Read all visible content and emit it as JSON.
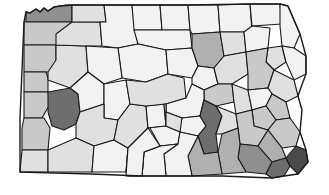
{
  "figure": {
    "name": "pennsylvania-county-choropleth",
    "title": "",
    "background_color": "#ffffff",
    "border_color": "#1a1a1a"
  },
  "chart_data": {
    "type": "choropleth",
    "title": "",
    "subtitle": "",
    "xlabel": "",
    "ylabel": "",
    "region": "Pennsylvania",
    "unit": "county",
    "grid": false,
    "legend_position": "none",
    "palette": {
      "level_0": "#f2f2f2",
      "level_1": "#e0e0e0",
      "level_2": "#c9c9c9",
      "level_3": "#b0b0b0",
      "level_4": "#8f8f8f",
      "level_5": "#6e6e6e",
      "level_6": "#4a4a4a"
    },
    "categories": [
      "Erie",
      "Crawford",
      "Warren",
      "McKean",
      "Potter",
      "Tioga",
      "Bradford",
      "Susquehanna",
      "Wayne",
      "Mercer",
      "Venango",
      "Forest",
      "Elk",
      "Cameron",
      "Clinton",
      "Lycoming",
      "Sullivan",
      "Wyoming",
      "Lackawanna",
      "Pike",
      "Lawrence",
      "Butler",
      "Clarion",
      "Jefferson",
      "Clearfield",
      "Centre",
      "Union",
      "Snyder",
      "Northumberland",
      "Montour",
      "Columbia",
      "Luzerne",
      "Monroe",
      "Beaver",
      "Allegheny",
      "Armstrong",
      "Indiana",
      "Cambria",
      "Blair",
      "Huntingdon",
      "Mifflin",
      "Juniata",
      "Perry",
      "Dauphin",
      "Schuylkill",
      "Carbon",
      "Northampton",
      "Lehigh",
      "Berks",
      "Lebanon",
      "Washington",
      "Westmoreland",
      "Somerset",
      "Bedford",
      "Fulton",
      "Franklin",
      "Cumberland",
      "York",
      "Lancaster",
      "Chester",
      "Montgomery",
      "Bucks",
      "Delaware",
      "Philadelphia",
      "Greene",
      "Fayette",
      "Adams",
      "Mercer-north",
      "Venango-east"
    ],
    "values": [
      4,
      2,
      1,
      0,
      0,
      0,
      0,
      0,
      0,
      2,
      1,
      0,
      0,
      0,
      0,
      3,
      0,
      0,
      2,
      0,
      2,
      1,
      0,
      0,
      0,
      1,
      0,
      0,
      2,
      0,
      0,
      2,
      1,
      2,
      5,
      0,
      0,
      1,
      0,
      0,
      0,
      0,
      0,
      5,
      1,
      0,
      2,
      2,
      2,
      1,
      2,
      1,
      0,
      0,
      0,
      0,
      1,
      3,
      3,
      4,
      3,
      2,
      5,
      6,
      1,
      1,
      0,
      2,
      1
    ],
    "value_range": [
      0,
      6
    ]
  },
  "map": {
    "name": "pennsylvania-counties",
    "counties": [
      {
        "name": "Erie",
        "shade": "#8f8f8f",
        "d": "M26,22 L26,12 L30,13 L36,9 L40,12 L44,8 L48,11 L54,7 L60,6 L66,5 L72,5 L72,22 Z"
      },
      {
        "name": "Crawford",
        "shade": "#c9c9c9",
        "d": "M24,22 L72,22 L72,45 L24,45 Z"
      },
      {
        "name": "Mercer",
        "shade": "#c9c9c9",
        "d": "M24,45 L56,45 L56,72 L24,72 Z"
      },
      {
        "name": "Lawrence",
        "shade": "#c9c9c9",
        "d": "M24,72 L46,72 L48,78 L48,92 L24,92 Z"
      },
      {
        "name": "Beaver",
        "shade": "#c9c9c9",
        "d": "M24,92 L48,92 L50,104 L42,118 L24,118 Z"
      },
      {
        "name": "Washington",
        "shade": "#c9c9c9",
        "d": "M24,118 L44,118 L50,128 L48,150 L22,150 L22,128 Z"
      },
      {
        "name": "Greene",
        "shade": "#e0e0e0",
        "d": "M22,150 L48,150 L48,172 L20,172 Z"
      },
      {
        "name": "Allegheny",
        "shade": "#6e6e6e",
        "d": "M48,92 L70,88 L78,94 L80,112 L76,124 L64,130 L52,126 L48,112 Z"
      },
      {
        "name": "Butler",
        "shade": "#e0e0e0",
        "d": "M56,45 L86,46 L88,72 L70,88 L48,80 L48,72 L56,60 Z"
      },
      {
        "name": "Venango",
        "shade": "#e0e0e0",
        "d": "M72,22 L100,22 L102,46 L86,46 L56,45 L56,34 Z"
      },
      {
        "name": "Warren",
        "shade": "#e0e0e0",
        "d": "M72,5 L104,5 L106,22 L72,22 Z"
      },
      {
        "name": "Forest-Elk",
        "shade": "#f2f2f2",
        "d": "M104,5 L132,5 L134,22 L138,44 L118,48 L102,46 L100,22 L106,22 Z"
      },
      {
        "name": "McKean",
        "shade": "#f2f2f2",
        "d": "M132,5 L160,5 L162,30 L134,30 Z"
      },
      {
        "name": "Potter",
        "shade": "#f2f2f2",
        "d": "M160,5 L188,5 L190,30 L162,30 Z"
      },
      {
        "name": "Cameron",
        "shade": "#f2f2f2",
        "d": "M162,30 L190,30 L192,48 L166,50 L138,44 L134,30 Z"
      },
      {
        "name": "Clearfield",
        "shade": "#f2f2f2",
        "d": "M118,48 L138,44 L166,50 L168,74 L146,82 L122,78 Z"
      },
      {
        "name": "Clarion-Jefferson",
        "shade": "#f2f2f2",
        "d": "M86,46 L118,48 L122,78 L104,84 L88,72 Z"
      },
      {
        "name": "Armstrong",
        "shade": "#f2f2f2",
        "d": "M88,72 L104,84 L104,104 L80,112 L78,94 L70,88 Z"
      },
      {
        "name": "Indiana",
        "shade": "#f2f2f2",
        "d": "M104,84 L126,80 L130,104 L118,120 L104,118 L104,104 Z"
      },
      {
        "name": "Westmoreland",
        "shade": "#e0e0e0",
        "d": "M80,112 L104,104 L104,118 L118,120 L114,140 L94,146 L76,138 L76,124 Z"
      },
      {
        "name": "Fayette",
        "shade": "#e0e0e0",
        "d": "M48,150 L76,138 L94,146 L92,172 L48,172 Z"
      },
      {
        "name": "Somerset",
        "shade": "#f2f2f2",
        "d": "M94,146 L114,140 L128,148 L126,172 L92,172 Z"
      },
      {
        "name": "Cambria",
        "shade": "#e0e0e0",
        "d": "M118,120 L130,104 L146,106 L148,128 L128,148 L114,140 Z"
      },
      {
        "name": "Blair",
        "shade": "#f2f2f2",
        "d": "M146,106 L164,104 L166,126 L148,128 Z"
      },
      {
        "name": "Centre",
        "shade": "#e0e0e0",
        "d": "M146,82 L168,74 L184,78 L186,98 L166,104 L146,106 L130,104 L126,80 Z"
      },
      {
        "name": "Clinton",
        "shade": "#f2f2f2",
        "d": "M166,50 L192,48 L198,66 L192,78 L168,74 Z"
      },
      {
        "name": "Tioga",
        "shade": "#f2f2f2",
        "d": "M188,5 L218,5 L220,32 L192,34 L190,30 Z"
      },
      {
        "name": "Bradford",
        "shade": "#f2f2f2",
        "d": "M218,5 L250,4 L252,32 L220,32 Z"
      },
      {
        "name": "Susquehanna",
        "shade": "#f2f2f2",
        "d": "M250,4 L280,4 L282,24 L252,26 Z"
      },
      {
        "name": "Wayne",
        "shade": "#f2f2f2",
        "d": "M280,4 L288,6 L294,20 L300,34 L294,48 L282,46 L280,26 Z"
      },
      {
        "name": "Lycoming",
        "shade": "#b0b0b0",
        "d": "M192,34 L220,32 L224,56 L214,68 L198,66 L192,48 Z"
      },
      {
        "name": "Sullivan",
        "shade": "#e0e0e0",
        "d": "M220,32 L244,32 L246,52 L224,56 Z"
      },
      {
        "name": "Wyoming",
        "shade": "#f2f2f2",
        "d": "M244,32 L252,26 L270,28 L268,48 L246,52 Z"
      },
      {
        "name": "Lackawanna",
        "shade": "#e0e0e0",
        "d": "M268,48 L282,46 L286,62 L274,70 L266,62 Z"
      },
      {
        "name": "Pike",
        "shade": "#f2f2f2",
        "d": "M294,48 L306,56 L306,74 L294,80 L286,62 L282,46 Z"
      },
      {
        "name": "Union-Snyder",
        "shade": "#f2f2f2",
        "d": "M198,66 L214,68 L218,84 L204,90 L192,84 L192,78 Z"
      },
      {
        "name": "Montour-Columbia",
        "shade": "#e0e0e0",
        "d": "M214,68 L224,56 L246,52 L248,74 L232,84 L218,84 Z"
      },
      {
        "name": "Luzerne",
        "shade": "#c9c9c9",
        "d": "M246,52 L268,48 L266,62 L274,70 L268,88 L248,90 L248,74 Z"
      },
      {
        "name": "Monroe",
        "shade": "#e0e0e0",
        "d": "M274,70 L294,80 L298,96 L286,102 L272,94 L268,88 Z"
      },
      {
        "name": "Northumberland",
        "shade": "#c9c9c9",
        "d": "M204,90 L218,84 L232,84 L234,102 L216,106 L204,100 Z"
      },
      {
        "name": "Schuylkill",
        "shade": "#e0e0e0",
        "d": "M232,84 L248,90 L252,110 L236,114 L234,102 Z"
      },
      {
        "name": "Carbon",
        "shade": "#f2f2f2",
        "d": "M248,90 L268,88 L272,94 L266,106 L252,110 Z"
      },
      {
        "name": "Northampton",
        "shade": "#c9c9c9",
        "d": "M272,94 L286,102 L290,118 L276,120 L266,106 Z"
      },
      {
        "name": "Lehigh",
        "shade": "#c9c9c9",
        "d": "M266,106 L276,120 L268,130 L254,126 L252,110 Z"
      },
      {
        "name": "Juniata-Mifflin",
        "shade": "#f2f2f2",
        "d": "M166,104 L186,98 L192,84 L204,90 L204,100 L200,116 L182,118 L166,112 Z"
      },
      {
        "name": "Huntingdon",
        "shade": "#f2f2f2",
        "d": "M164,104 L166,104 L166,126 L180,132 L178,144 L160,146 L150,128 L148,128 L166,126 Z"
      },
      {
        "name": "Perry",
        "shade": "#f2f2f2",
        "d": "M182,118 L200,116 L206,126 L198,136 L180,132 L180,124 Z"
      },
      {
        "name": "Dauphin",
        "shade": "#6e6e6e",
        "d": "M204,100 L216,106 L222,116 L216,134 L218,152 L204,154 L198,136 L206,126 L200,116 Z"
      },
      {
        "name": "Lebanon",
        "shade": "#e0e0e0",
        "d": "M216,106 L236,114 L238,128 L222,134 L216,134 L222,116 Z"
      },
      {
        "name": "Berks",
        "shade": "#c9c9c9",
        "d": "M236,114 L252,110 L254,126 L268,130 L258,146 L240,144 L238,128 Z"
      },
      {
        "name": "Bucks",
        "shade": "#c9c9c9",
        "d": "M276,120 L290,118 L300,132 L296,146 L282,148 L268,130 Z"
      },
      {
        "name": "Montgomery",
        "shade": "#b0b0b0",
        "d": "M268,130 L282,148 L286,158 L272,162 L258,146 Z"
      },
      {
        "name": "Chester",
        "shade": "#8f8f8f",
        "d": "M240,144 L258,146 L272,162 L266,174 L246,172 L238,158 Z"
      },
      {
        "name": "Delaware",
        "shade": "#6e6e6e",
        "d": "M266,174 L272,162 L286,158 L290,166 L284,176 L272,178 Z"
      },
      {
        "name": "Philadelphia",
        "shade": "#4a4a4a",
        "d": "M286,158 L296,146 L306,150 L308,162 L298,174 L290,166 Z"
      },
      {
        "name": "Lancaster",
        "shade": "#b0b0b0",
        "d": "M218,152 L222,134 L238,128 L240,144 L238,158 L246,172 L222,174 Z"
      },
      {
        "name": "York",
        "shade": "#b0b0b0",
        "d": "M198,136 L204,154 L218,152 L222,174 L192,176 L188,156 Z"
      },
      {
        "name": "Adams",
        "shade": "#f2f2f2",
        "d": "M178,144 L180,132 L198,136 L188,156 L192,176 L166,176 L164,154 Z"
      },
      {
        "name": "Cumberland",
        "shade": "#e0e0e0",
        "d": "M180,132 L182,118 L166,112 L166,126 L180,132 Z"
      },
      {
        "name": "Franklin",
        "shade": "#f2f2f2",
        "d": "M160,146 L178,144 L164,154 L166,176 L142,176 L144,152 Z"
      },
      {
        "name": "Fulton",
        "shade": "#f2f2f2",
        "d": "M144,152 L160,146 L144,152 L142,176 L128,176 L126,172 L128,148 Z"
      },
      {
        "name": "Bedford",
        "shade": "#f2f2f2",
        "d": "M128,148 L148,128 L160,146 L144,152 L142,176 L126,176 Z"
      }
    ],
    "outline": "M20,172 L20,118 L24,22 L26,12 L30,13 L36,9 L40,12 L44,8 L48,11 L54,7 L60,6 L72,5 L132,5 L188,5 L250,4 L280,4 L288,6 L294,20 L300,34 L306,56 L306,74 L300,90 L298,96 L302,110 L300,132 L306,150 L308,162 L298,174 L284,176 L272,178 L222,176 L192,176 L142,176 L92,174 L20,172 Z"
  }
}
